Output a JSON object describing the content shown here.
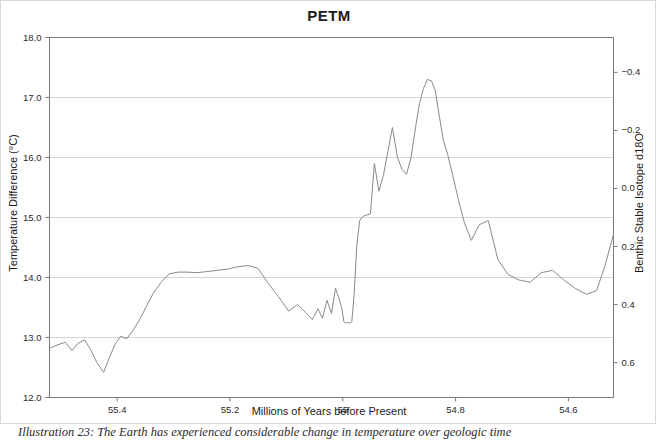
{
  "figure": {
    "title": "PETM",
    "caption": "Illustration 23: The Earth has experienced considerable change in temperature over geologic time"
  },
  "chart_data": {
    "type": "line",
    "title": "PETM",
    "xlabel": "Millions of Years before Present",
    "ylabel": "Temperature Difference (°C)",
    "y2label": "Benthic Stable Isotope d18O",
    "grid": true,
    "legend": false,
    "line_color": "#8a8a8a",
    "xlim": [
      55.52,
      54.52
    ],
    "xticks": [
      55.4,
      55.2,
      55.0,
      54.8,
      54.6
    ],
    "xticklabels": [
      "55.4",
      "55.2",
      "55",
      "54.8",
      "54.6"
    ],
    "ylim": [
      12.0,
      18.0
    ],
    "yticks": [
      12.0,
      13.0,
      14.0,
      15.0,
      16.0,
      17.0,
      18.0
    ],
    "yticklabels": [
      "12.0",
      "13.0",
      "14.0",
      "15.0",
      "16.0",
      "17.0",
      "18.0"
    ],
    "y2lim": [
      0.72,
      -0.52
    ],
    "y2ticks": [
      -0.4,
      -0.2,
      0.0,
      0.2,
      0.4,
      0.6
    ],
    "y2ticklabels": [
      "−0.4",
      "−0.2",
      "0.0",
      "0.2",
      "0.4",
      "0.6"
    ],
    "series": [
      {
        "name": "Temperature Difference",
        "x": [
          55.52,
          55.505,
          55.492,
          55.48,
          55.47,
          55.458,
          55.447,
          55.436,
          55.424,
          55.414,
          55.404,
          55.394,
          55.383,
          55.372,
          55.36,
          55.348,
          55.336,
          55.322,
          55.308,
          55.292,
          55.276,
          55.258,
          55.24,
          55.222,
          55.204,
          55.186,
          55.168,
          55.15,
          55.132,
          55.114,
          55.096,
          55.08,
          55.066,
          55.054,
          55.044,
          55.036,
          55.028,
          55.02,
          55.013,
          55.007,
          55.002,
          54.998,
          54.995,
          54.991,
          54.988,
          54.984,
          54.98,
          54.975,
          54.97,
          54.964,
          54.958,
          54.951,
          54.944,
          54.936,
          54.928,
          54.92,
          54.912,
          54.903,
          54.895,
          54.887,
          54.879,
          54.871,
          54.864,
          54.857,
          54.85,
          54.843,
          54.836,
          54.829,
          54.822,
          54.814,
          54.805,
          54.795,
          54.784,
          54.772,
          54.758,
          54.742,
          54.725,
          54.707,
          54.688,
          54.668,
          54.648,
          54.628,
          54.608,
          54.588,
          54.568,
          54.55,
          54.535,
          54.52
        ],
        "y": [
          12.82,
          12.88,
          12.92,
          12.78,
          12.9,
          12.96,
          12.8,
          12.58,
          12.42,
          12.66,
          12.88,
          13.02,
          12.98,
          13.12,
          13.3,
          13.52,
          13.74,
          13.92,
          14.06,
          14.09,
          14.09,
          14.08,
          14.1,
          14.12,
          14.14,
          14.18,
          14.2,
          14.15,
          13.9,
          13.68,
          13.44,
          13.55,
          13.42,
          13.3,
          13.48,
          13.32,
          13.62,
          13.4,
          13.82,
          13.66,
          13.5,
          13.26,
          13.24,
          13.25,
          13.24,
          13.26,
          13.7,
          14.55,
          14.95,
          15.02,
          15.04,
          15.06,
          15.9,
          15.44,
          15.7,
          16.1,
          16.5,
          16.0,
          15.8,
          15.72,
          16.0,
          16.5,
          16.9,
          17.15,
          17.3,
          17.28,
          17.12,
          16.7,
          16.3,
          16.05,
          15.7,
          15.3,
          14.9,
          14.62,
          14.88,
          14.95,
          14.3,
          14.05,
          13.96,
          13.92,
          14.08,
          14.12,
          13.96,
          13.82,
          13.72,
          13.78,
          14.2,
          14.72
        ]
      }
    ]
  },
  "axes": {
    "left_title": "Temperature Difference (°C)",
    "right_title": "Benthic Stable Isotope d18O",
    "x_title": "Millions of Years before Present"
  }
}
